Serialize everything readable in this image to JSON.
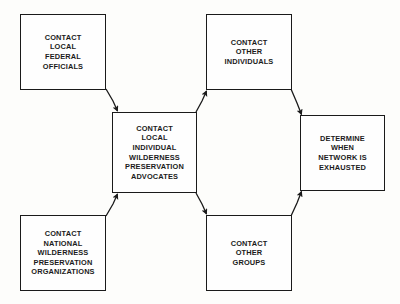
{
  "diagram": {
    "background_color": "#fdfdfb",
    "line_color": "#1a1a1a",
    "text_color": "#1b1b1b",
    "nodes": [
      {
        "id": "local-federal",
        "label": "CONTACT\nLOCAL\nFEDERAL\nOFFICIALS"
      },
      {
        "id": "other-individuals",
        "label": "CONTACT\nOTHER\nINDIVIDUALS"
      },
      {
        "id": "local-advocates",
        "label": "CONTACT\nLOCAL\nINDIVIDUAL\nWILDERNESS\nPRESERVATION\nADVOCATES"
      },
      {
        "id": "determine-network",
        "label": "DETERMINE\nWHEN\nNETWORK IS\nEXHAUSTED"
      },
      {
        "id": "national-orgs",
        "label": "CONTACT\nNATIONAL\nWILDERNESS\nPRESERVATION\nORGANIZATIONS"
      },
      {
        "id": "other-groups",
        "label": "CONTACT\nOTHER\nGROUPS"
      }
    ],
    "connectors": [
      {
        "id": "federal-to-advocates",
        "from": "local-federal",
        "to": "local-advocates",
        "direction": "down-right",
        "path": "M 106 89 L 113 101 L 118 112"
      },
      {
        "id": "national-to-advocates",
        "from": "national-orgs",
        "to": "local-advocates",
        "direction": "up-right",
        "path": "M 106 216 L 113 204 L 118 193"
      },
      {
        "id": "advocates-to-individuals",
        "from": "local-advocates",
        "to": "other-individuals",
        "direction": "up-right",
        "path": "M 196 112 L 202 101 L 207 90"
      },
      {
        "id": "advocates-to-groups",
        "from": "local-advocates",
        "to": "other-groups",
        "direction": "down-right",
        "path": "M 196 193 L 202 204 L 207 215"
      },
      {
        "id": "individuals-to-determine",
        "from": "other-individuals",
        "to": "determine-network",
        "direction": "down-right",
        "path": "M 291 89 L 297 104 L 302 116"
      },
      {
        "id": "groups-to-determine",
        "from": "other-groups",
        "to": "determine-network",
        "direction": "up-right",
        "path": "M 291 216 L 297 202 L 302 190"
      }
    ]
  }
}
